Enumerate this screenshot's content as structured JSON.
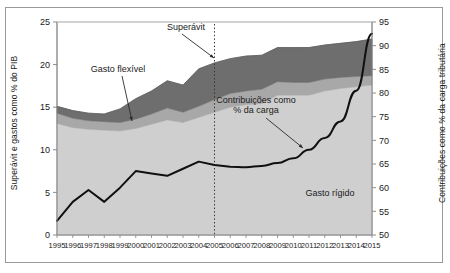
{
  "chart_data": {
    "type": "area",
    "title": "",
    "xlabel": "",
    "ylabel": "Superávit e gastos como % do PIB",
    "ylabel_right": "Contribuições como % da carga tributária",
    "ylim": [
      0,
      25
    ],
    "ylim_right": [
      50,
      95
    ],
    "grid": false,
    "legend_position": "inline-annotations",
    "categories": [
      "1995",
      "1996",
      "1997",
      "1998",
      "1999",
      "2000",
      "2001",
      "2002",
      "2003",
      "2004",
      "2005",
      "2006",
      "2007",
      "2008",
      "2009",
      "2010",
      "2011",
      "2012",
      "2013",
      "2014",
      "2015"
    ],
    "yticks_left": [
      0,
      5,
      10,
      15,
      20,
      25
    ],
    "yticks_right": [
      50,
      55,
      60,
      65,
      70,
      75,
      80,
      85,
      90,
      95
    ],
    "series": [
      {
        "name": "Gasto rígido",
        "axis": "left",
        "kind": "stacked-area",
        "color": "#cfcfcf",
        "values": [
          13.1,
          12.6,
          12.4,
          12.3,
          12.2,
          12.5,
          13.0,
          13.5,
          13.2,
          13.8,
          14.4,
          15.0,
          15.3,
          15.4,
          16.4,
          16.4,
          16.4,
          16.9,
          17.2,
          17.4,
          17.6
        ]
      },
      {
        "name": "Gasto flexível",
        "axis": "left",
        "kind": "stacked-area",
        "color": "#a8a8a8",
        "values": [
          1.2,
          1.1,
          1.0,
          1.0,
          1.0,
          1.1,
          1.2,
          1.4,
          1.2,
          1.3,
          1.5,
          1.6,
          1.6,
          1.7,
          1.6,
          1.5,
          1.5,
          1.4,
          1.3,
          1.2,
          1.1
        ]
      },
      {
        "name": "Superávit",
        "axis": "left",
        "kind": "stacked-area",
        "color": "#6e6e6e",
        "values": [
          0.8,
          0.9,
          0.9,
          0.9,
          1.6,
          2.4,
          2.7,
          3.2,
          3.2,
          4.4,
          4.3,
          4.1,
          4.1,
          4.0,
          4.0,
          4.1,
          4.1,
          4.0,
          4.0,
          4.1,
          4.3
        ]
      },
      {
        "name": "Contribuições como % da carga",
        "axis": "right",
        "kind": "line",
        "color": "#101010",
        "values": [
          53.0,
          57.0,
          59.5,
          57.0,
          60.0,
          63.5,
          63.0,
          62.5,
          64.0,
          65.5,
          64.8,
          64.4,
          64.3,
          64.6,
          65.2,
          66.2,
          68.0,
          70.5,
          74.0,
          80.5,
          92.5
        ]
      }
    ],
    "annotations": [
      {
        "text": "Superávit",
        "target_series": "Superávit"
      },
      {
        "text": "Gasto flexível",
        "target_series": "Gasto flexível"
      },
      {
        "text": "Contribuições como\n% da carga",
        "line1": "Contribuições como",
        "line2": "% da carga",
        "target_series": "Contribuições como % da carga"
      },
      {
        "text": "Gasto rígido",
        "target_series": "Gasto rígido"
      }
    ],
    "vertical_marker": {
      "year": "2005",
      "style": "dotted",
      "color": "#333333"
    }
  },
  "colors": {
    "band_rigid": "#cfcfcf",
    "band_flexible": "#a8a8a8",
    "band_surplus": "#6e6e6e",
    "line": "#101010",
    "axis": "#808080",
    "frame": "#9a9a9a",
    "text": "#1a1a1a"
  }
}
